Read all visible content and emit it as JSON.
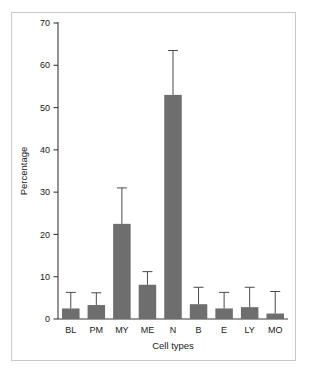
{
  "figure": {
    "background_color": "#ffffff",
    "frame_color": "#c9c9c9",
    "bar_color": "#6e6e6e",
    "axis_color": "#3a3a3a",
    "text_color": "#1a1a1a"
  },
  "chart_data": {
    "type": "bar",
    "title": "",
    "subtitle": "",
    "xlabel": "Cell types",
    "ylabel": "Percentage",
    "categories": [
      "BL",
      "PM",
      "MY",
      "ME",
      "N",
      "B",
      "E",
      "LY",
      "MO"
    ],
    "values": [
      2.5,
      3.3,
      22.5,
      8.1,
      53.0,
      3.5,
      2.5,
      2.8,
      1.3
    ],
    "error_upper": [
      3.8,
      2.9,
      8.5,
      3.1,
      10.5,
      4.0,
      3.8,
      4.7,
      5.2
    ],
    "error_top_values": [
      6.3,
      6.2,
      31.0,
      11.2,
      63.5,
      7.5,
      6.3,
      7.5,
      6.5
    ],
    "ylim": [
      0,
      70
    ],
    "yticks": [
      0,
      10,
      20,
      30,
      40,
      50,
      60,
      70
    ],
    "ytick_labels": [
      "0",
      "10",
      "20",
      "30",
      "40",
      "50",
      "60",
      "70"
    ],
    "grid": false,
    "legend": null,
    "legend_position": "none",
    "error_bar_style": "upper-only-with-cap",
    "annotations": []
  }
}
